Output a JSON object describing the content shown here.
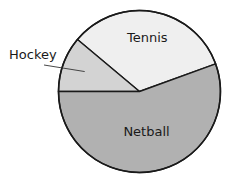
{
  "chart_data": {
    "type": "pie",
    "title": "",
    "start_angle_deg": 20,
    "direction": "counterclockwise",
    "slices": [
      {
        "label": "Tennis",
        "degrees": 120,
        "value_fraction": 0.3333,
        "color": "#efefef",
        "label_placement": "inside"
      },
      {
        "label": "Hockey",
        "degrees": 40,
        "value_fraction": 0.1111,
        "color": "#d3d3d3",
        "label_placement": "outside-left-with-leader"
      },
      {
        "label": "Netball",
        "degrees": 200,
        "value_fraction": 0.5556,
        "color": "#b1b1b1",
        "label_placement": "inside"
      }
    ],
    "legend": "none"
  }
}
